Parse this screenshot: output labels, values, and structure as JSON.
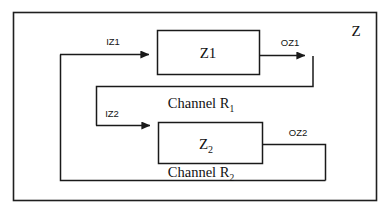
{
  "diagram": {
    "title_label": "Z",
    "outer_system": {
      "name": "Z",
      "label": "Z"
    },
    "blocks": [
      {
        "id": "z1",
        "label": "Z1",
        "sub": ""
      },
      {
        "id": "z2",
        "label": "Z",
        "sub": "2"
      }
    ],
    "signals": [
      {
        "id": "iz1",
        "label": "IZ1",
        "kind": "input",
        "arrow": true
      },
      {
        "id": "oz1",
        "label": "OZ1",
        "kind": "output",
        "arrow": true
      },
      {
        "id": "iz2",
        "label": "IZ2",
        "kind": "input",
        "arrow": true
      },
      {
        "id": "oz2",
        "label": "OZ2",
        "kind": "output",
        "arrow": false
      }
    ],
    "channels": [
      {
        "id": "r1",
        "label": "Channel R",
        "sub": "1"
      },
      {
        "id": "r2",
        "label": "Channel R",
        "sub": "2"
      }
    ],
    "colors": {
      "background": "#ffffff",
      "line": "#1a1a1a",
      "text": "#121212",
      "border": "#1f1f1f"
    }
  }
}
